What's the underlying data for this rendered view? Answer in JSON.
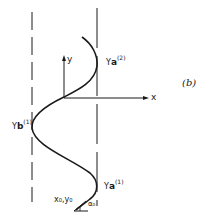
{
  "figure": {
    "panel_label": "(b)",
    "axes": {
      "x_label": "x",
      "y_label": "y"
    },
    "labels": {
      "ya2": {
        "base": "Y",
        "sub": "a",
        "sup": "(2)"
      },
      "yb1": {
        "base": "Y",
        "sub": "b",
        "sup": "(1)"
      },
      "ya1": {
        "base": "Y",
        "sub": "a",
        "sup": "(1)"
      },
      "origin": "x₀,y₀",
      "angle": "α₀"
    },
    "colors": {
      "ink": "#1a1a1a",
      "background": "#ffffff"
    }
  }
}
